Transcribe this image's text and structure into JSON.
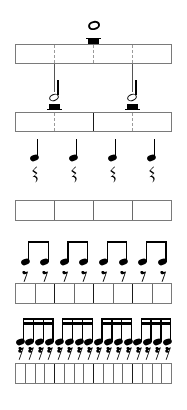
{
  "diagram": {
    "type": "music-notation-duration-chart",
    "background_color": "#ffffff",
    "ink_color": "#000000",
    "box_border_color": "#7a7a7a",
    "beat_divider_color": "#1a1a1a",
    "dashed_divider_color": "#9a9a9a"
  },
  "rows": [
    {
      "id": "whole",
      "note_name": "whole-note",
      "rest_name": "whole-rest",
      "note_count": 1,
      "cells": 4,
      "beams": 0,
      "divider_style": "dashed",
      "beat_group": 4,
      "note_positions": [
        93.5
      ],
      "box": {
        "x": 15,
        "y": 44,
        "width": 157,
        "height": 20
      }
    },
    {
      "id": "half",
      "note_name": "half-note",
      "rest_name": "half-rest",
      "note_count": 2,
      "cells": 4,
      "beams": 0,
      "divider_style": "mixed",
      "beat_group": 2,
      "note_positions": [
        54,
        132
      ],
      "box": {
        "x": 15,
        "y": 112,
        "width": 157,
        "height": 20
      }
    },
    {
      "id": "quarter",
      "note_name": "quarter-note",
      "rest_name": "quarter-rest",
      "note_count": 4,
      "cells": 4,
      "beams": 0,
      "divider_style": "solid",
      "beat_group": 1,
      "note_positions": [
        34,
        73,
        112,
        151
      ],
      "box": {
        "x": 15,
        "y": 200,
        "width": 157,
        "height": 21
      }
    },
    {
      "id": "eighth",
      "note_name": "eighth-note",
      "rest_name": "eighth-rest",
      "note_count": 8,
      "cells": 8,
      "beams": 1,
      "divider_style": "solid",
      "beat_group": 2,
      "group_size": 2,
      "box": {
        "x": 15,
        "y": 283,
        "width": 157,
        "height": 21
      }
    },
    {
      "id": "sixteenth",
      "note_name": "sixteenth-note",
      "rest_name": "sixteenth-rest",
      "note_count": 16,
      "cells": 16,
      "beams": 2,
      "divider_style": "solid",
      "beat_group": 4,
      "group_size": 4,
      "box": {
        "x": 15,
        "y": 363,
        "width": 157,
        "height": 21
      }
    }
  ],
  "connectors": [
    {
      "from": "whole-box",
      "to": "half-note-1",
      "x": 54,
      "y1": 64,
      "y2": 92
    },
    {
      "from": "whole-box",
      "to": "half-note-2",
      "x": 132,
      "y1": 64,
      "y2": 92
    }
  ],
  "labels": {
    "whole": "",
    "half": "",
    "quarter": "",
    "eighth": "",
    "sixteenth": ""
  }
}
